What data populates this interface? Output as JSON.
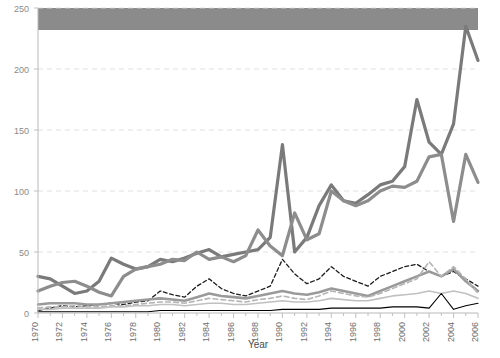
{
  "figure": {
    "background_color": "#ffffff",
    "legend_bar": {
      "label": "legend-band",
      "color": "#8b8b8b",
      "x": 38,
      "y": 8,
      "width": 440,
      "height": 22
    }
  },
  "chart_data": {
    "type": "line",
    "title": "",
    "subtitle": "",
    "xlabel": "Year",
    "ylabel": "",
    "xlim": [
      1970,
      2006
    ],
    "ylim": [
      0,
      250
    ],
    "grid": true,
    "grid_axis": "y",
    "legend_position": "top",
    "yticks": [
      0,
      50,
      100,
      150,
      200,
      250
    ],
    "ytick_labels": [
      "0",
      "50",
      "100",
      "150",
      "200",
      "250"
    ],
    "xticks": [
      1970,
      1972,
      1974,
      1976,
      1978,
      1980,
      1982,
      1984,
      1986,
      1988,
      1990,
      1992,
      1994,
      1996,
      1998,
      2000,
      2002,
      2004,
      2006
    ],
    "xtick_labels": [
      "1970",
      "1972",
      "1974",
      "1976",
      "1978",
      "1980",
      "1982",
      "1984",
      "1986",
      "1988",
      "1990",
      "1992",
      "1994",
      "1996",
      "1998",
      "2000",
      "2002",
      "2004",
      "2006"
    ],
    "x": [
      1970,
      1971,
      1972,
      1973,
      1974,
      1975,
      1976,
      1977,
      1978,
      1979,
      1980,
      1981,
      1982,
      1983,
      1984,
      1985,
      1986,
      1987,
      1988,
      1989,
      1990,
      1991,
      1992,
      1993,
      1994,
      1995,
      1996,
      1997,
      1998,
      1999,
      2000,
      2001,
      2002,
      2003,
      2004,
      2005,
      2006
    ],
    "series": [
      {
        "name": "series-a",
        "color": "#7a7a7a",
        "width": 3.2,
        "style": "solid",
        "values": [
          30,
          28,
          22,
          16,
          18,
          26,
          45,
          40,
          36,
          38,
          44,
          42,
          45,
          49,
          52,
          46,
          48,
          50,
          52,
          62,
          138,
          50,
          62,
          88,
          105,
          92,
          90,
          97,
          105,
          108,
          120,
          175,
          140,
          130,
          155,
          235,
          207
        ]
      },
      {
        "name": "series-b",
        "color": "#8d8d8d",
        "width": 3.2,
        "style": "solid",
        "values": [
          18,
          22,
          25,
          26,
          22,
          17,
          14,
          30,
          36,
          38,
          40,
          44,
          43,
          50,
          44,
          46,
          42,
          47,
          68,
          55,
          47,
          82,
          60,
          65,
          100,
          92,
          88,
          92,
          100,
          104,
          103,
          108,
          128,
          130,
          75,
          130,
          107
        ]
      },
      {
        "name": "series-c",
        "color": "#1c1c1c",
        "width": 1.3,
        "style": "dashed",
        "values": [
          2,
          4,
          6,
          5,
          6,
          7,
          8,
          7,
          9,
          10,
          18,
          15,
          13,
          22,
          28,
          20,
          16,
          14,
          18,
          22,
          44,
          32,
          24,
          28,
          38,
          30,
          26,
          22,
          30,
          34,
          38,
          40,
          34,
          30,
          34,
          28,
          22
        ]
      },
      {
        "name": "series-d",
        "color": "#9a9a9a",
        "width": 2.6,
        "style": "solid",
        "values": [
          7,
          8,
          8,
          8,
          7,
          7,
          8,
          9,
          10,
          11,
          12,
          11,
          10,
          13,
          16,
          14,
          13,
          12,
          14,
          16,
          18,
          16,
          15,
          17,
          20,
          18,
          16,
          14,
          18,
          22,
          26,
          30,
          34,
          30,
          36,
          26,
          18
        ]
      },
      {
        "name": "series-e",
        "color": "#b5b5b5",
        "width": 1.6,
        "style": "dashed",
        "values": [
          4,
          5,
          5,
          6,
          5,
          5,
          6,
          6,
          7,
          8,
          9,
          9,
          8,
          10,
          12,
          11,
          10,
          9,
          11,
          12,
          14,
          12,
          11,
          14,
          18,
          16,
          14,
          13,
          16,
          20,
          24,
          28,
          42,
          30,
          38,
          28,
          16
        ]
      },
      {
        "name": "series-f",
        "color": "#c0c0c0",
        "width": 1.6,
        "style": "solid",
        "values": [
          3,
          3,
          4,
          4,
          4,
          4,
          5,
          5,
          6,
          6,
          7,
          7,
          6,
          7,
          8,
          8,
          7,
          7,
          8,
          9,
          10,
          9,
          9,
          10,
          12,
          11,
          10,
          10,
          12,
          14,
          15,
          16,
          18,
          16,
          18,
          16,
          12
        ]
      },
      {
        "name": "series-g",
        "color": "#000000",
        "width": 1.1,
        "style": "solid",
        "values": [
          1,
          1,
          1,
          1,
          1,
          1,
          1,
          1,
          1,
          1,
          2,
          2,
          2,
          2,
          2,
          2,
          2,
          2,
          2,
          2,
          3,
          3,
          3,
          3,
          4,
          4,
          4,
          4,
          4,
          5,
          5,
          5,
          4,
          16,
          3,
          6,
          8
        ]
      }
    ]
  }
}
